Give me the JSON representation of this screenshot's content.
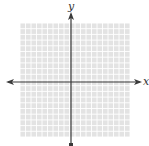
{
  "figure": {
    "type": "coordinate-plane",
    "x_axis_label": "x",
    "y_axis_label": "y",
    "grid": {
      "left": 20,
      "top": 23,
      "right": 130,
      "bottom": 137,
      "cells": 20,
      "line_color": "#ffffff",
      "fill_color": "#e3e3e3"
    },
    "axes": {
      "origin_x": 71,
      "origin_y": 82,
      "color": "#3a3a3a"
    }
  }
}
